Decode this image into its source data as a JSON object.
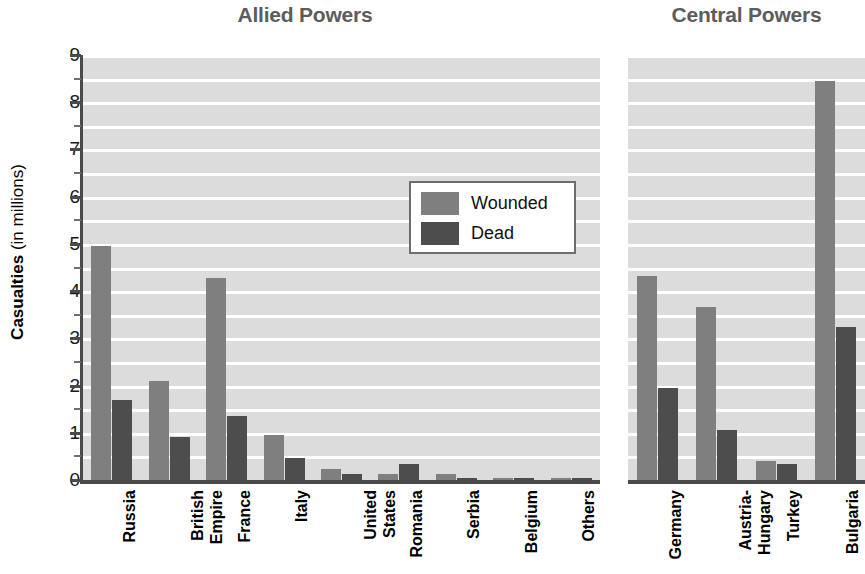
{
  "figure": {
    "yaxis_title_bold": "Casualties",
    "yaxis_title_regular": " (in millions)",
    "y_ticks": [
      "9",
      "8",
      "7",
      "6",
      "5",
      "4",
      "3",
      "2",
      "1",
      "0"
    ]
  },
  "legend": {
    "items": [
      {
        "label": "Wounded",
        "color": "#7f7f7f",
        "key": "wounded"
      },
      {
        "label": "Dead",
        "color": "#4d4d4d",
        "key": "dead"
      }
    ]
  },
  "chart_data": [
    {
      "type": "bar",
      "title": "Allied Powers",
      "xlabel": "",
      "ylabel": "Casualties (in millions)",
      "ylim": [
        0,
        9
      ],
      "grid": true,
      "legend_position": "inside-upper-right",
      "categories": [
        "Russia",
        "British Empire",
        "France",
        "Italy",
        "United States",
        "Romania",
        "Serbia",
        "Belgium",
        "Others"
      ],
      "category_lines": [
        [
          "Russia"
        ],
        [
          "British",
          "Empire"
        ],
        [
          "France"
        ],
        [
          "Italy"
        ],
        [
          "United",
          "States"
        ],
        [
          "Romania"
        ],
        [
          "Serbia"
        ],
        [
          "Belgium"
        ],
        [
          "Others"
        ]
      ],
      "series": [
        {
          "name": "Wounded",
          "color": "#7f7f7f",
          "values": [
            4.95,
            2.1,
            4.27,
            0.95,
            0.23,
            0.12,
            0.13,
            0.04,
            0.02
          ]
        },
        {
          "name": "Dead",
          "color": "#4d4d4d",
          "values": [
            1.7,
            0.91,
            1.36,
            0.46,
            0.12,
            0.34,
            0.05,
            0.01,
            0.01
          ]
        }
      ]
    },
    {
      "type": "bar",
      "title": "Central Powers",
      "xlabel": "",
      "ylabel": "Casualties (in millions)",
      "ylim": [
        0,
        9
      ],
      "grid": true,
      "legend_position": "none",
      "categories": [
        "Germany",
        "Austria-Hungary",
        "Turkey",
        "Bulgaria"
      ],
      "category_lines": [
        [
          "Germany"
        ],
        [
          "Austria-",
          "Hungary"
        ],
        [
          "Turkey"
        ],
        [
          "Bulgaria"
        ]
      ],
      "series": [
        {
          "name": "Wounded",
          "color": "#7f7f7f",
          "values": [
            4.32,
            3.67,
            0.4,
            8.45
          ]
        },
        {
          "name": "Dead",
          "color": "#4d4d4d",
          "values": [
            1.94,
            1.05,
            0.33,
            3.25
          ]
        }
      ]
    }
  ]
}
